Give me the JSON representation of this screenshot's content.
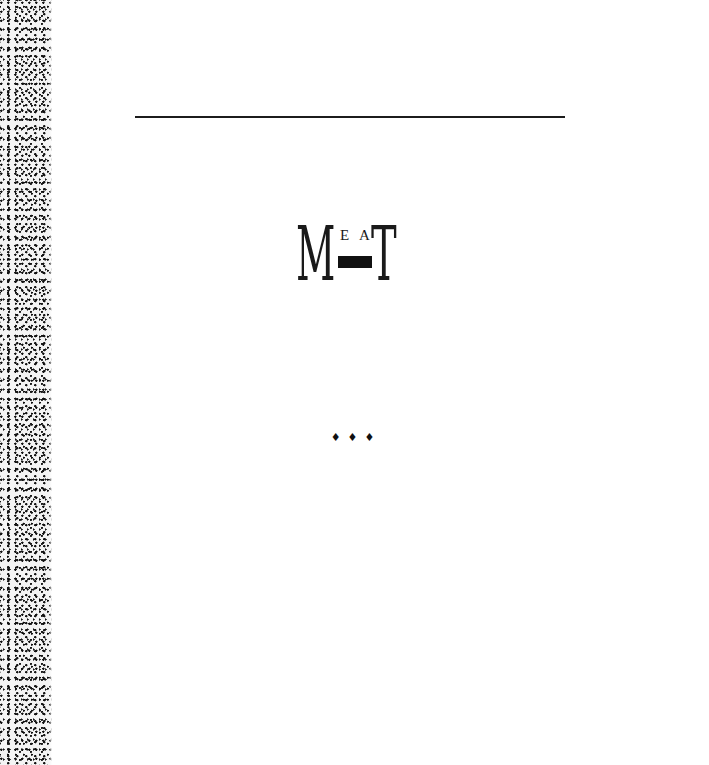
{
  "page": {
    "type": "book-half-title",
    "background": "#ffffff"
  },
  "title_logo": {
    "text": "MEAT",
    "big_left": "M",
    "small_first": "E",
    "small_second": "A",
    "big_right": "T",
    "bar_color": "#111111"
  },
  "ornament": {
    "text": "♦♦♦",
    "icon": "diamond-icon",
    "count": 3
  },
  "decor": {
    "rule_color": "#1c1c1c",
    "edge_strip": "speckled-paper-edge"
  }
}
